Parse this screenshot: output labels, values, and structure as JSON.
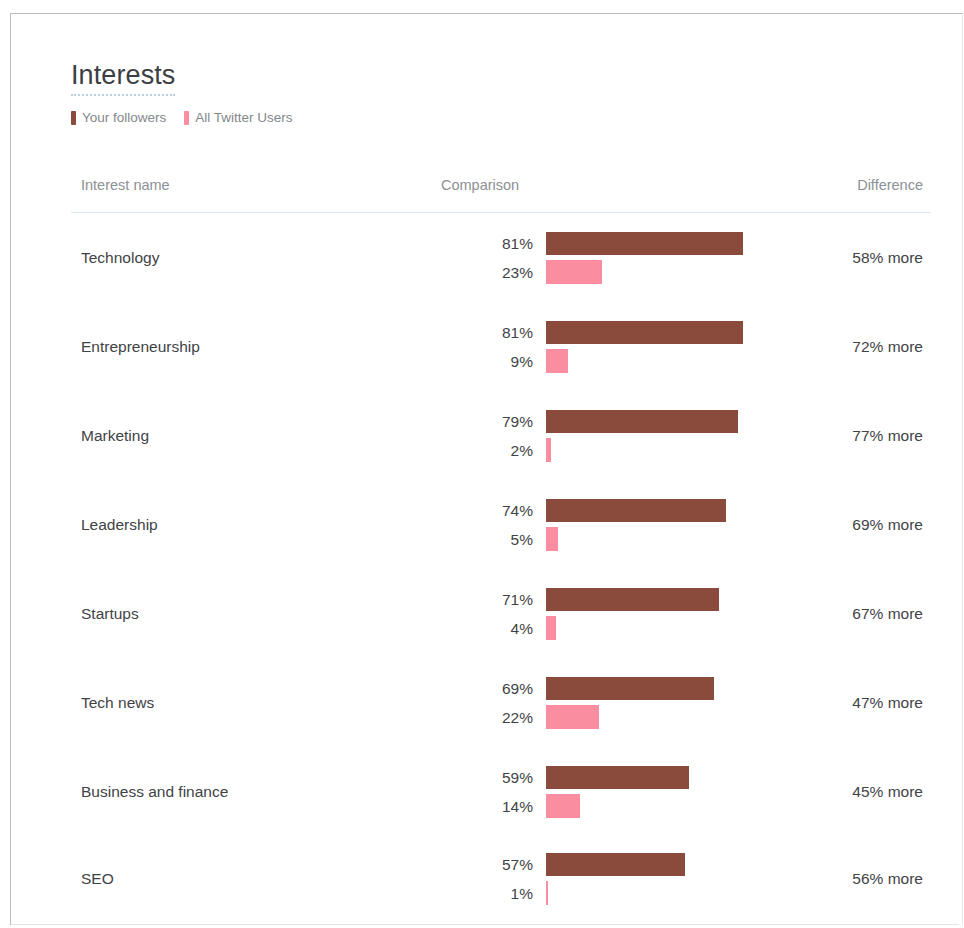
{
  "card": {
    "title": "Interests"
  },
  "legend": {
    "items": [
      {
        "label": "Your followers",
        "color": "#8a4a3c",
        "swatch_icon": "legend-swatch-icon"
      },
      {
        "label": "All Twitter Users",
        "color": "#fa8da0",
        "swatch_icon": "legend-swatch-icon"
      }
    ]
  },
  "table": {
    "columns": {
      "name": "Interest name",
      "comparison": "Comparison",
      "difference": "Difference"
    },
    "rows": [
      {
        "name": "Technology",
        "followers_label": "81%",
        "followers_value": 81,
        "all_users_label": "23%",
        "all_users_value": 23,
        "difference": "58% more"
      },
      {
        "name": "Entrepreneurship",
        "followers_label": "81%",
        "followers_value": 81,
        "all_users_label": "9%",
        "all_users_value": 9,
        "difference": "72% more"
      },
      {
        "name": "Marketing",
        "followers_label": "79%",
        "followers_value": 79,
        "all_users_label": "2%",
        "all_users_value": 2,
        "difference": "77% more"
      },
      {
        "name": "Leadership",
        "followers_label": "74%",
        "followers_value": 74,
        "all_users_label": "5%",
        "all_users_value": 5,
        "difference": "69% more"
      },
      {
        "name": "Startups",
        "followers_label": "71%",
        "followers_value": 71,
        "all_users_label": "4%",
        "all_users_value": 4,
        "difference": "67% more"
      },
      {
        "name": "Tech news",
        "followers_label": "69%",
        "followers_value": 69,
        "all_users_label": "22%",
        "all_users_value": 22,
        "difference": "47% more"
      },
      {
        "name": "Business and finance",
        "followers_label": "59%",
        "followers_value": 59,
        "all_users_label": "14%",
        "all_users_value": 14,
        "difference": "45% more"
      },
      {
        "name": "SEO",
        "followers_label": "57%",
        "followers_value": 57,
        "all_users_label": "1%",
        "all_users_value": 1,
        "difference": "56% more"
      }
    ]
  },
  "colors": {
    "followers": "#8a4a3c",
    "all_users": "#fa8da0",
    "title_underline": "#b9cfe0",
    "header_rule": "#dde6ee",
    "header_text": "#8b9095",
    "body_text": "#3f4346"
  },
  "chart_data": {
    "type": "bar",
    "title": "Interests",
    "xlabel": "",
    "ylabel": "",
    "xlim": [
      0,
      100
    ],
    "grid": false,
    "legend_position": "top-left",
    "orientation": "horizontal",
    "unit": "%",
    "categories": [
      "Technology",
      "Entrepreneurship",
      "Marketing",
      "Leadership",
      "Startups",
      "Tech news",
      "Business and finance",
      "SEO"
    ],
    "series": [
      {
        "name": "Your followers",
        "color": "#8a4a3c",
        "values": [
          81,
          81,
          79,
          74,
          71,
          69,
          59,
          57
        ]
      },
      {
        "name": "All Twitter Users",
        "color": "#fa8da0",
        "values": [
          23,
          9,
          2,
          5,
          4,
          22,
          14,
          1
        ]
      }
    ],
    "annotations": {
      "difference": [
        "58% more",
        "72% more",
        "77% more",
        "69% more",
        "67% more",
        "47% more",
        "45% more",
        "56% more"
      ]
    },
    "bar_px_per_percent": 2.43
  }
}
